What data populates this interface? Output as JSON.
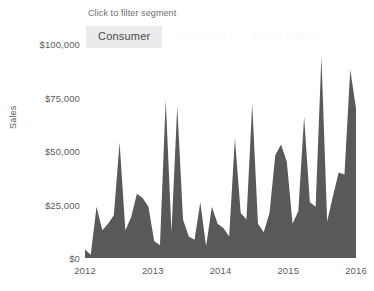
{
  "filter": {
    "hint": "Click to filter segment",
    "segments": [
      {
        "label": "Consumer",
        "state": "active"
      },
      {
        "label": "Corporate",
        "state": "inactive"
      },
      {
        "label": "Home Office",
        "state": "inactive"
      }
    ]
  },
  "colors": {
    "area_fill": "#595959",
    "active_button_bg": "#ebebeb",
    "text": "#5d5d5d",
    "background": "#ffffff"
  },
  "chart_data": {
    "type": "area",
    "title": "",
    "subtitle": "",
    "xlabel": "",
    "ylabel": "Sales",
    "grid": false,
    "legend_position": "top",
    "legend_entries": [
      "Consumer",
      "Corporate",
      "Home Office"
    ],
    "series_name": "Consumer",
    "ylim": [
      0,
      112000
    ],
    "y_ticks": [
      0,
      25000,
      50000,
      75000,
      100000
    ],
    "y_tick_labels": [
      "$0",
      "$25,000",
      "$50,000",
      "$75,000",
      "$100,000"
    ],
    "x_ticks": [
      "2012",
      "2013",
      "2014",
      "2015",
      "2016"
    ],
    "x_tick_values": [
      0,
      12,
      24,
      36,
      48
    ],
    "xlim": [
      0,
      48
    ],
    "x": [
      "2012-01",
      "2012-02",
      "2012-03",
      "2012-04",
      "2012-05",
      "2012-06",
      "2012-07",
      "2012-08",
      "2012-09",
      "2012-10",
      "2012-11",
      "2012-12",
      "2013-01",
      "2013-02",
      "2013-03",
      "2013-04",
      "2013-05",
      "2013-06",
      "2013-07",
      "2013-08",
      "2013-09",
      "2013-10",
      "2013-11",
      "2013-12",
      "2014-01",
      "2014-02",
      "2014-03",
      "2014-04",
      "2014-05",
      "2014-06",
      "2014-07",
      "2014-08",
      "2014-09",
      "2014-10",
      "2014-11",
      "2014-12",
      "2015-01",
      "2015-02",
      "2015-03",
      "2015-04",
      "2015-05",
      "2015-06",
      "2015-07",
      "2015-08",
      "2015-09",
      "2015-10",
      "2015-11",
      "2015-12"
    ],
    "values": [
      4000,
      1500,
      24000,
      13000,
      16000,
      20000,
      54000,
      13000,
      19000,
      30000,
      28000,
      24000,
      8000,
      6000,
      74000,
      12000,
      71000,
      18000,
      10000,
      8500,
      26000,
      5500,
      24000,
      16000,
      14000,
      10000,
      56000,
      21000,
      18000,
      72000,
      16000,
      12000,
      21000,
      48000,
      53000,
      45000,
      16000,
      22000,
      66000,
      26000,
      24000,
      94000,
      17000,
      29000,
      40000,
      39000,
      88000,
      70000
    ],
    "values_note": "Monthly Consumer sales, estimated from the plotted area silhouette"
  }
}
